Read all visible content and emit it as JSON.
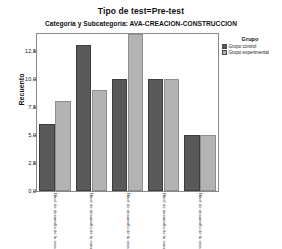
{
  "titles": {
    "main": "Tipo de test=Pre-test",
    "sub": "Categoría y Subcategoría: AVA-CREACION-CONSTRUCCION"
  },
  "legend": {
    "title": "Grupo",
    "items": [
      {
        "label": "Grupo control",
        "color": "#595959",
        "key": "control"
      },
      {
        "label": "Grupo experimental",
        "color": "#b3b3b3",
        "key": "experimental"
      }
    ]
  },
  "colors": {
    "control": "#595959",
    "experimental": "#b3b3b3",
    "frame": "#8a8a8a",
    "background": "#ffffff",
    "text": "#1a1a1a"
  },
  "chart_data": {
    "type": "bar",
    "title": "Tipo de test=Pre-test",
    "subtitle": "Categoría y Subcategoría: AVA-CREACION-CONSTRUCCION",
    "xlabel": "",
    "ylabel": "Recuento",
    "ylim": [
      0,
      14
    ],
    "yticks": [
      0.0,
      2.5,
      5.0,
      7.5,
      10.0,
      12.5
    ],
    "ytick_labels": [
      "0,0",
      "2,5",
      "5,0",
      "7,5",
      "10,0",
      "12,5"
    ],
    "grid": false,
    "legend_position": "right",
    "categories": [
      "Nivel de desarrollo de la creación",
      "Nivel de desarrollo de la construcción",
      "Nivel de desarrollo de la creación",
      "Nivel de desarrollo de la construcción",
      "Nivel de desarrollo de la creación"
    ],
    "series": [
      {
        "name": "Grupo control",
        "color": "#595959",
        "values": [
          6,
          13,
          10,
          10,
          5
        ]
      },
      {
        "name": "Grupo experimental",
        "color": "#b3b3b3",
        "values": [
          8,
          9,
          14,
          10,
          5
        ]
      }
    ]
  }
}
